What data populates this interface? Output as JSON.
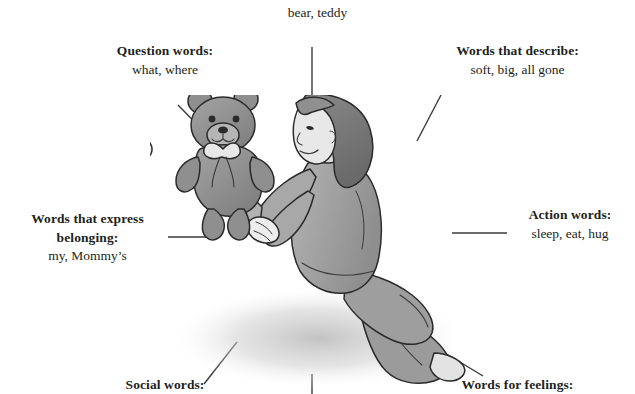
{
  "figure": {
    "title_visible": false,
    "background_color": "#ffffff",
    "text_color": "#231f20",
    "line_color": "#3a3a3a"
  },
  "illustration": {
    "name": "mother-toddler-teddy-bear-illustration",
    "description": "Grayscale line drawing of a kneeling mother holding a teddy bear toward a standing toddler who reaches up with both hands",
    "palette": {
      "outline": "#2b2b2b",
      "mid_gray": "#9a9a9a",
      "light_gray": "#c9c9c9",
      "dark_gray": "#6e6e6e",
      "shadow": "#d6d6d6"
    }
  },
  "labels": [
    {
      "id": "top-center",
      "header": "",
      "values": "bear, teddy"
    },
    {
      "id": "question-words",
      "header": "Question words:",
      "values": "what, where"
    },
    {
      "id": "words-that-describe",
      "header": "Words that describe:",
      "values": "soft, big, all gone"
    },
    {
      "id": "words-that-express-belonging",
      "header": "Words that express",
      "header2": "belonging:",
      "values": "my, Mommy’s"
    },
    {
      "id": "action-words",
      "header": "Action words:",
      "values": "sleep, eat, hug"
    },
    {
      "id": "social-words",
      "header": "Social words:",
      "values": ""
    },
    {
      "id": "words-for-feelings",
      "header": "Words for feelings:",
      "values": ""
    }
  ]
}
